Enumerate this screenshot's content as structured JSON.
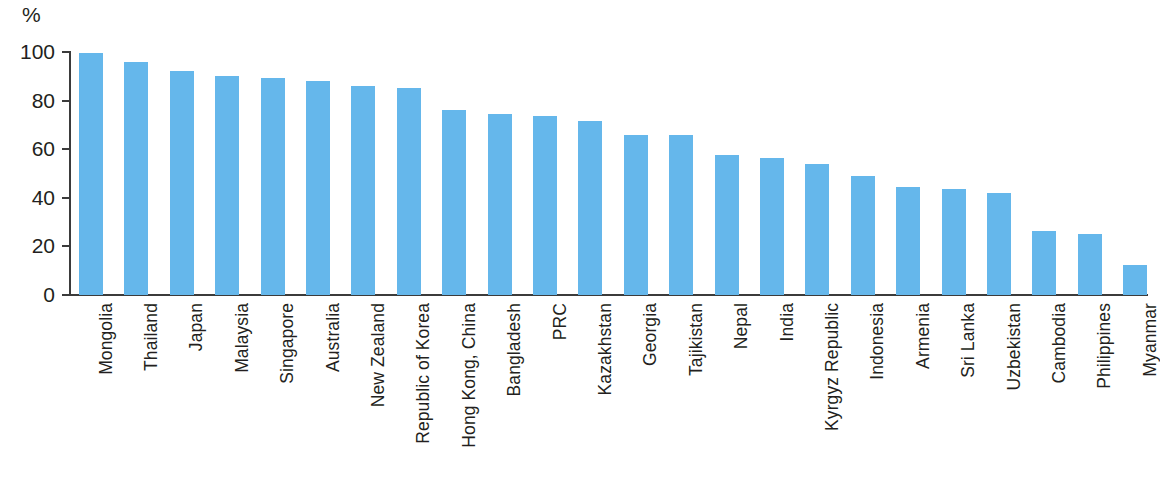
{
  "chart_data": {
    "type": "bar",
    "title": "",
    "xlabel": "",
    "ylabel": "%",
    "ylim": [
      0,
      100
    ],
    "ytick_labels": [
      "100",
      "80",
      "60",
      "40",
      "20",
      "0"
    ],
    "yticks": [
      100,
      80,
      60,
      40,
      20,
      0
    ],
    "grid": false,
    "legend": "none",
    "bar_color": "#65b7eb",
    "axis_color": "#3b3b3b",
    "categories": [
      "Mongolia",
      "Thailand",
      "Japan",
      "Malaysia",
      "Singapore",
      "Australia",
      "New Zealand",
      "Republic of Korea",
      "Hong Kong, China",
      "Bangladesh",
      "PRC",
      "Kazakhstan",
      "Georgia",
      "Tajikistan",
      "Nepal",
      "India",
      "Kyrgyz Republic",
      "Indonesia",
      "Armenia",
      "Sri Lanka",
      "Uzbekistan",
      "Cambodia",
      "Philippines",
      "Myanmar"
    ],
    "values": [
      99.5,
      96,
      92,
      90,
      89.5,
      88,
      86,
      85,
      76,
      74.5,
      73.5,
      71.5,
      66,
      66,
      57.5,
      56.5,
      54,
      49,
      44.5,
      43.5,
      42,
      26.5,
      25,
      12.5
    ]
  }
}
